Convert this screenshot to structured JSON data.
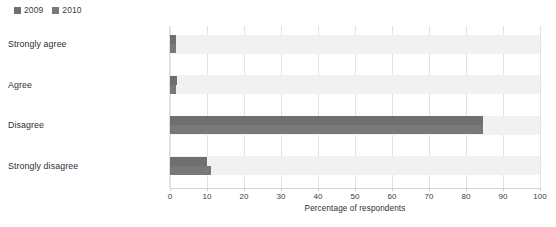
{
  "chart_data": {
    "type": "bar",
    "orientation": "horizontal",
    "title": "",
    "subtitle": "",
    "xlabel": "Percentage of respondents",
    "ylabel": "",
    "xlim": [
      0,
      100
    ],
    "xticks": [
      0,
      10,
      20,
      30,
      40,
      50,
      60,
      70,
      80,
      90,
      100
    ],
    "xtick_labels": [
      "0",
      "10",
      "20",
      "30",
      "40",
      "50",
      "60",
      "70",
      "80",
      "90",
      "100"
    ],
    "grid": "vertical",
    "legend_position": "top-left",
    "categories": [
      "Strongly agree",
      "Agree",
      "Disagree",
      "Strongly disagree"
    ],
    "series": [
      {
        "name": "2009",
        "color": "#6f6f6f",
        "values": [
          1.5,
          2.0,
          84.5,
          10.0
        ]
      },
      {
        "name": "2010",
        "color": "#787878",
        "values": [
          1.5,
          1.5,
          84.5,
          11.0
        ]
      }
    ]
  },
  "legend": {
    "entries": [
      {
        "label": "2009",
        "swatch_name": "legend-swatch-2009"
      },
      {
        "label": "2010",
        "swatch_name": "legend-swatch-2010"
      }
    ]
  },
  "colors": {
    "series_2009": "#6f6f6f",
    "series_2010": "#787878",
    "row_band": "#f1f1f1",
    "gridline": "#e3e3e3",
    "axis": "#d4d4d4",
    "text": "#3c3c3c",
    "background": "#ffffff"
  }
}
